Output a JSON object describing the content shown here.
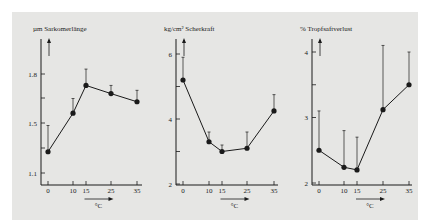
{
  "colors": {
    "background": "#e6e6e4",
    "ink": "#1a1a1a",
    "page": "#ffffff"
  },
  "chart_data": [
    {
      "type": "line",
      "title": "µm Sarkomerlänge",
      "xlabel": "°C",
      "ylabel": "µm Sarkomerlänge",
      "x": [
        0,
        10,
        15,
        25,
        35
      ],
      "x_ticks": [
        "0",
        "10",
        "15",
        "25",
        "35"
      ],
      "y_ticks": [
        "1.1",
        "1.5",
        "1.8"
      ],
      "series": [
        {
          "name": "Sarkomerlänge",
          "values": [
            1.27,
            1.56,
            1.73,
            1.68,
            1.63
          ]
        }
      ],
      "error_upper": [
        1.48,
        1.65,
        1.83,
        1.73,
        1.7
      ],
      "grid": false
    },
    {
      "type": "line",
      "title": "kg/cm² Scherkraft",
      "xlabel": "°C",
      "ylabel": "kg/cm² Scherkraft",
      "x": [
        0,
        10,
        15,
        25,
        35
      ],
      "x_ticks": [
        "0",
        "10",
        "15",
        "25",
        "35"
      ],
      "y_ticks": [
        "2",
        "4",
        "6"
      ],
      "ylim": [
        2,
        6.4
      ],
      "series": [
        {
          "name": "Scherkraft",
          "values": [
            5.2,
            3.3,
            3.0,
            3.1,
            4.25
          ]
        }
      ],
      "error_upper": [
        5.9,
        3.6,
        3.2,
        3.6,
        4.75
      ],
      "grid": false
    },
    {
      "type": "line",
      "title": "% Tropfsaftverlust",
      "xlabel": "°C",
      "ylabel": "% Tropfsaftverlust",
      "x": [
        0,
        10,
        15,
        25,
        35
      ],
      "x_ticks": [
        "0",
        "10",
        "15",
        "25",
        "35"
      ],
      "y_ticks": [
        "2",
        "3",
        "4"
      ],
      "ylim": [
        2,
        4.2
      ],
      "series": [
        {
          "name": "Tropfsaftverlust",
          "values": [
            2.5,
            2.24,
            2.2,
            3.12,
            3.5
          ]
        }
      ],
      "error_upper": [
        3.1,
        2.8,
        2.7,
        4.1,
        4.0
      ],
      "grid": false
    }
  ],
  "panels": [
    {
      "title": "µm Sarkomerlänge",
      "xunit": "°C"
    },
    {
      "title": "kg/cm² Scherkraft",
      "xunit": "°C"
    },
    {
      "title": "% Tropfsaftverlust",
      "xunit": "°C"
    }
  ]
}
